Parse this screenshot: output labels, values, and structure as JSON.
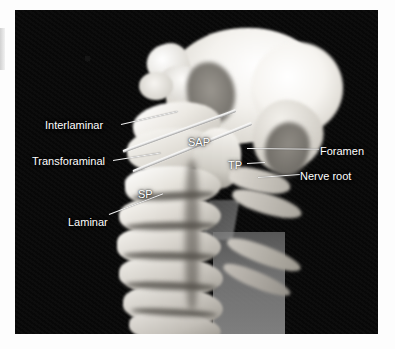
{
  "figure": {
    "kind": "anatomical-photograph",
    "background_color": "#0a0a0a",
    "bone_color": "#e9e7e2",
    "label_color": "#ffffff",
    "leader_color": "#f2f2f2"
  },
  "labels": {
    "interlaminar": "Interlaminar",
    "transforaminal": "Transforaminal",
    "laminar": "Laminar",
    "sap": "SAP",
    "tp": "TP",
    "sp": "SP",
    "foramen": "Foramen",
    "nerve_root": "Nerve root"
  },
  "annotations": [
    {
      "text": "Interlaminar",
      "side": "left",
      "has_leader": true
    },
    {
      "text": "Transforaminal",
      "side": "left",
      "has_leader": true
    },
    {
      "text": "Laminar",
      "side": "left",
      "has_leader": true
    },
    {
      "text": "SAP",
      "side": "inset",
      "has_leader": false
    },
    {
      "text": "TP",
      "side": "inset",
      "has_leader": true
    },
    {
      "text": "SP",
      "side": "inset",
      "has_leader": false
    },
    {
      "text": "Foramen",
      "side": "right",
      "has_leader": true
    },
    {
      "text": "Nerve root",
      "side": "right",
      "has_leader": true
    }
  ]
}
